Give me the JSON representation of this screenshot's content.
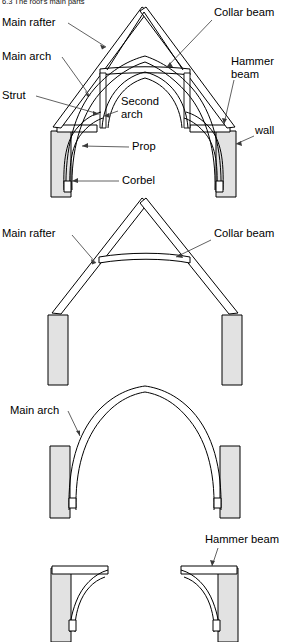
{
  "caption": {
    "number": "6.3",
    "text": "The roof's main parts",
    "full": "6.3  The roof's main parts"
  },
  "colors": {
    "wall_fill": "#e2e2e2",
    "timber_fill": "#ffffff",
    "line": "#000000",
    "leader": "#3a3a3a",
    "background": "#ffffff"
  },
  "panels": [
    {
      "id": "panel-full-truss",
      "name": "complete-truss-assembly",
      "labels": [
        {
          "key": "main_rafter",
          "text": "Main rafter",
          "x": 2,
          "y": 26,
          "anchor": "start",
          "lines": [
            "Main rafter"
          ]
        },
        {
          "key": "main_arch",
          "text": "Main arch",
          "x": 2,
          "y": 60,
          "anchor": "start",
          "lines": [
            "Main arch"
          ]
        },
        {
          "key": "strut",
          "text": "Strut",
          "x": 2,
          "y": 99,
          "anchor": "start",
          "lines": [
            "Strut"
          ]
        },
        {
          "key": "collar_beam",
          "text": "Collar beam",
          "x": 214,
          "y": 16,
          "anchor": "start",
          "lines": [
            "Collar beam"
          ]
        },
        {
          "key": "hammer_beam",
          "text": "Hammer beam",
          "x": 231,
          "y": 65,
          "anchor": "start",
          "lines": [
            "Hammer",
            "beam"
          ]
        },
        {
          "key": "wall",
          "text": "wall",
          "x": 255,
          "y": 134,
          "anchor": "start",
          "lines": [
            "wall"
          ]
        },
        {
          "key": "second_arch",
          "text": "Second arch",
          "x": 121,
          "y": 105,
          "anchor": "start",
          "lines": [
            "Second",
            "arch"
          ]
        },
        {
          "key": "prop",
          "text": "Prop",
          "x": 132,
          "y": 150,
          "anchor": "start",
          "lines": [
            "Prop"
          ]
        },
        {
          "key": "corbel",
          "text": "Corbel",
          "x": 122,
          "y": 184,
          "anchor": "start",
          "lines": [
            "Corbel"
          ]
        }
      ]
    },
    {
      "id": "panel-rafters-collar",
      "name": "main-rafters-and-collar-beam",
      "labels": [
        {
          "key": "main_rafter",
          "text": "Main rafter",
          "x": 2,
          "y": 237,
          "anchor": "start",
          "lines": [
            "Main rafter"
          ]
        },
        {
          "key": "collar_beam",
          "text": "Collar beam",
          "x": 214,
          "y": 237,
          "anchor": "start",
          "lines": [
            "Collar beam"
          ]
        }
      ]
    },
    {
      "id": "panel-main-arch",
      "name": "main-arch-only",
      "labels": [
        {
          "key": "main_arch",
          "text": "Main arch",
          "x": 10,
          "y": 414,
          "anchor": "start",
          "lines": [
            "Main arch"
          ]
        }
      ]
    },
    {
      "id": "panel-hammer-beams",
      "name": "hammer-beams-and-braces",
      "labels": [
        {
          "key": "hammer_beam",
          "text": "Hammer beam",
          "x": 205,
          "y": 543,
          "anchor": "start",
          "lines": [
            "Hammer beam"
          ]
        }
      ]
    }
  ],
  "parts_glossary": [
    "Main rafter",
    "Main arch",
    "Strut",
    "Collar beam",
    "Hammer beam",
    "Second arch",
    "Prop",
    "Corbel",
    "wall"
  ]
}
